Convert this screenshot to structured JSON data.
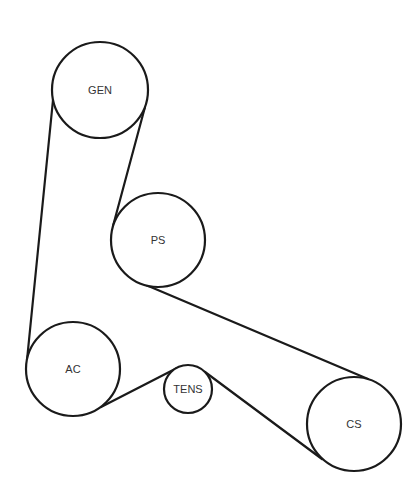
{
  "diagram": {
    "type": "belt-routing",
    "colors": {
      "line": "#1a1a1a",
      "label": "#333333",
      "background": "#ffffff"
    },
    "pulleys": [
      {
        "id": "gen",
        "label": "GEN",
        "cx": 100,
        "cy": 90,
        "r": 48
      },
      {
        "id": "ps",
        "label": "PS",
        "cx": 158,
        "cy": 240,
        "r": 47
      },
      {
        "id": "ac",
        "label": "AC",
        "cx": 73,
        "cy": 369,
        "r": 47
      },
      {
        "id": "tens",
        "label": "TENS",
        "cx": 188,
        "cy": 389,
        "r": 24
      },
      {
        "id": "cs",
        "label": "CS",
        "cx": 354,
        "cy": 424,
        "r": 47
      }
    ],
    "belt_segments": [
      {
        "from": "gen",
        "to": "ac",
        "x1": 53,
        "y1": 100,
        "x2": 27,
        "y2": 360
      },
      {
        "from": "gen",
        "to": "ps",
        "x1": 145,
        "y1": 107,
        "x2": 113,
        "y2": 226
      },
      {
        "from": "ps",
        "to": "cs",
        "x1": 146,
        "y1": 285,
        "x2": 368,
        "y2": 379
      },
      {
        "from": "cs",
        "to": "tens",
        "x1": 322,
        "y1": 459,
        "x2": 205,
        "y2": 372
      },
      {
        "from": "tens",
        "to": "ac",
        "x1": 177,
        "y1": 368,
        "x2": 101,
        "y2": 407
      }
    ]
  }
}
